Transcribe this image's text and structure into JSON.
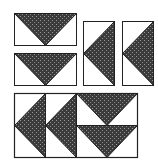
{
  "diagram": {
    "colors": {
      "background": "#ffffff",
      "fabric_dark": "#3b3b3b",
      "fabric_speckle": "#9a9a9a",
      "outline": "#222222"
    },
    "units": [
      {
        "id": "goose-h-1",
        "orientation": "point-down",
        "x": 14,
        "y": 13,
        "w": 62,
        "h": 32
      },
      {
        "id": "goose-h-2",
        "orientation": "point-down",
        "x": 14,
        "y": 53,
        "w": 62,
        "h": 32
      },
      {
        "id": "goose-v-1",
        "orientation": "point-left",
        "x": 83,
        "y": 21,
        "w": 31,
        "h": 64
      },
      {
        "id": "goose-v-2",
        "orientation": "point-left",
        "x": 122,
        "y": 21,
        "w": 31,
        "h": 64
      }
    ],
    "assembled_block": {
      "x": 14,
      "y": 93,
      "w": 123,
      "h": 64,
      "units": [
        {
          "id": "asm-v-1",
          "orientation": "point-left",
          "x": 14,
          "y": 93,
          "w": 31,
          "h": 64
        },
        {
          "id": "asm-v-2",
          "orientation": "point-left",
          "x": 45,
          "y": 93,
          "w": 31,
          "h": 64
        },
        {
          "id": "asm-h-1",
          "orientation": "point-down",
          "x": 76,
          "y": 93,
          "w": 61,
          "h": 32
        },
        {
          "id": "asm-h-2",
          "orientation": "point-down",
          "x": 76,
          "y": 125,
          "w": 61,
          "h": 32
        }
      ]
    }
  }
}
